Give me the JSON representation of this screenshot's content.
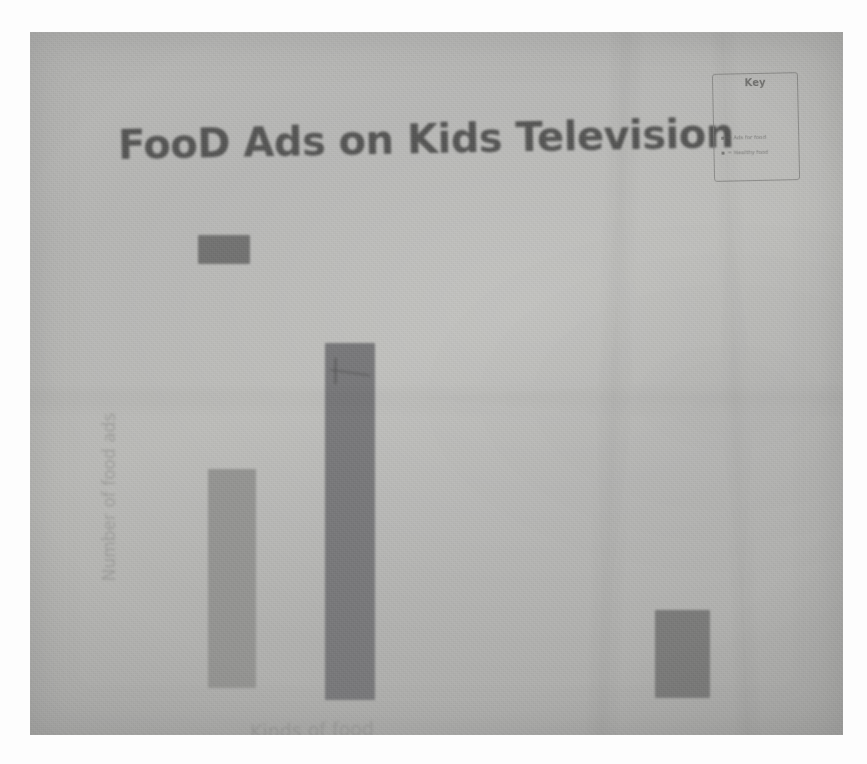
{
  "media": {
    "kind": "photograph-of-handdrawn-poster",
    "surface": "poster-paper"
  },
  "chart_data": {
    "type": "bar",
    "title": "FooD Ads on Kids Television",
    "xlabel": "Kinds of food",
    "ylabel": "Number of food ads",
    "categories": [
      "bar-1",
      "bar-2",
      "bar-3"
    ],
    "values": [
      19,
      30,
      7
    ],
    "ylim": [
      0,
      34
    ],
    "grid": false,
    "tick_labels_visible": false,
    "axis_lines_visible": false,
    "legend": {
      "visible": true,
      "position": "top-left-under-title",
      "entries": [
        {
          "label": "",
          "swatch_color": "#6f6f6e"
        }
      ]
    },
    "bars": [
      {
        "name": "bar-1",
        "value": 19,
        "color": "#949492",
        "x": 178,
        "y": 437,
        "width": 48,
        "height": 219
      },
      {
        "name": "bar-2",
        "value": 30,
        "color": "#78787a",
        "x": 295,
        "y": 311,
        "width": 50,
        "height": 357
      },
      {
        "name": "bar-3",
        "value": 7,
        "color": "#7a7a79",
        "x": 625,
        "y": 578,
        "width": 55,
        "height": 88
      }
    ],
    "annotations": [
      {
        "name": "bar-2-scribble",
        "text": "",
        "note": "faint marker scribble at top of tallest bar"
      }
    ]
  },
  "title_text": "FooD Ads on Kids Television",
  "key_box": {
    "heading": "Key",
    "entries": [
      {
        "marker": "▪",
        "text": "= Ads for food"
      },
      {
        "marker": "▪",
        "text": "= Healthy food"
      }
    ]
  },
  "colors": {
    "poster_paper": "#b6b6b4",
    "marker_dark": "#4d4d4c",
    "pencil_gray": "#8d8d8b",
    "bar_light": "#949492",
    "bar_dark": "#78787a",
    "photo_margin": "#ffffff"
  }
}
